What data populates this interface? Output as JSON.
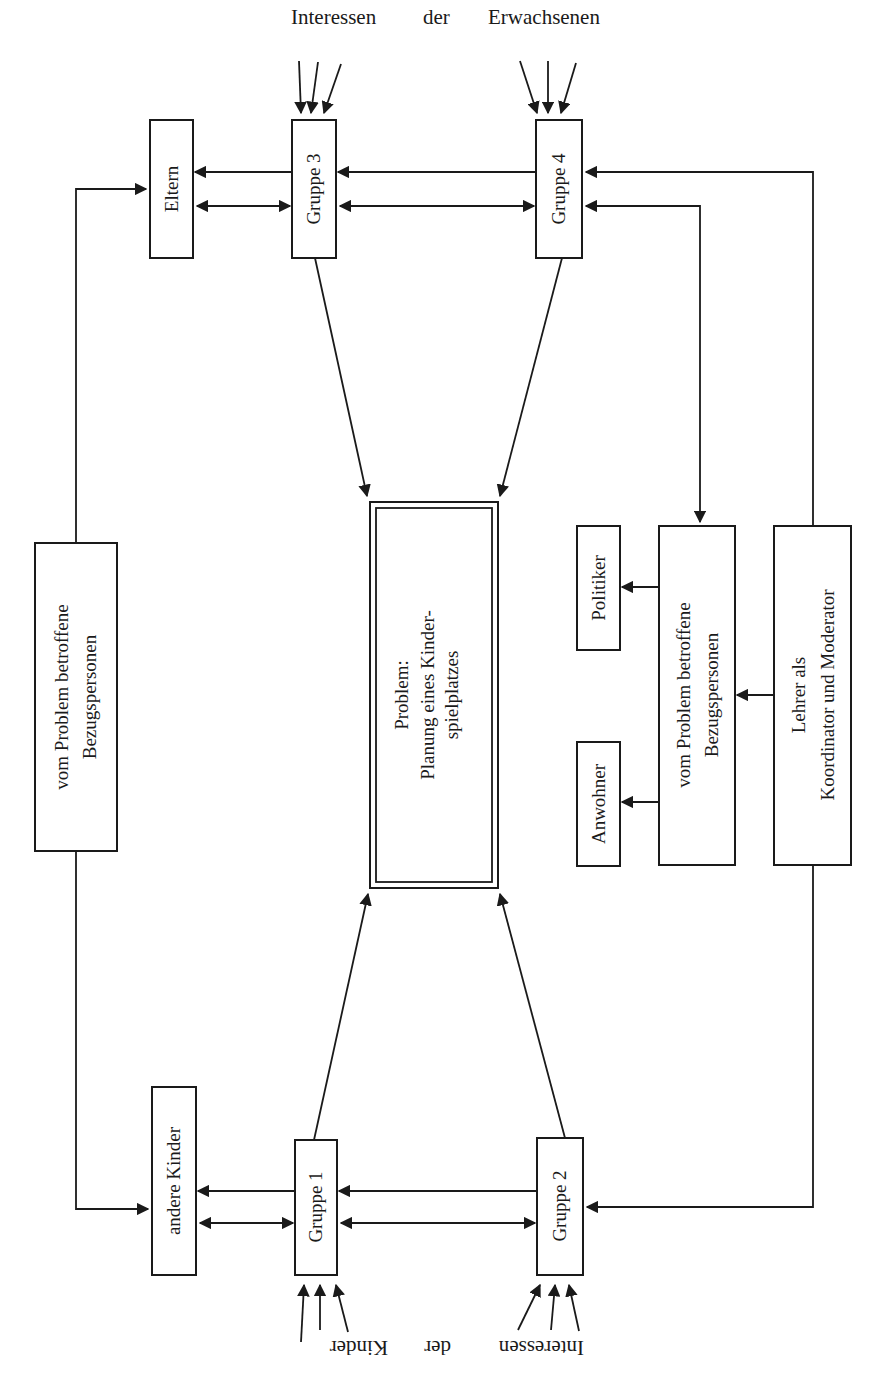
{
  "diagram": {
    "top_label": {
      "word1": "Interessen",
      "word2": "der",
      "word3": "Erwachsenen"
    },
    "bottom_label": {
      "word1": "Interessen",
      "word2": "der",
      "word3": "Kinder",
      "orientation": "rotated 180°"
    },
    "center": {
      "line1": "Problem:",
      "line2": "Planung eines Kinder-",
      "line3": "spielplatzes"
    },
    "groups": {
      "g1": "Gruppe 1",
      "g2": "Gruppe 2",
      "g3": "Gruppe 3",
      "g4": "Gruppe 4"
    },
    "left_side": {
      "eltern": "Eltern",
      "andere_kinder": "andere Kinder",
      "bezug_line1": "vom Problem betroffene",
      "bezug_line2": "Bezugspersonen"
    },
    "right_side": {
      "politiker": "Politiker",
      "anwohner": "Anwohner",
      "bezug_line1": "vom Problem betroffene",
      "bezug_line2": "Bezugspersonen",
      "lehrer_line1": "Lehrer als",
      "lehrer_line2": "Koordinator und Moderator"
    },
    "colors": {
      "ink": "#1a1a1a",
      "paper": "#ffffff"
    }
  }
}
